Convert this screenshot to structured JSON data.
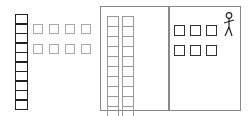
{
  "diagram": {
    "left_column": {
      "cells": 10,
      "color": "#222222"
    },
    "gray_squares": {
      "rows": 2,
      "per_row": 4,
      "color": "#aaaaaa"
    },
    "box": {
      "border_color": "#888888",
      "left_section": {
        "columns": 2,
        "cells_per_column": 10,
        "color": "#999999"
      },
      "right_section": {
        "rows": 2,
        "per_row": 3,
        "color": "#333333",
        "figure": "stick-figure-icon"
      }
    }
  }
}
